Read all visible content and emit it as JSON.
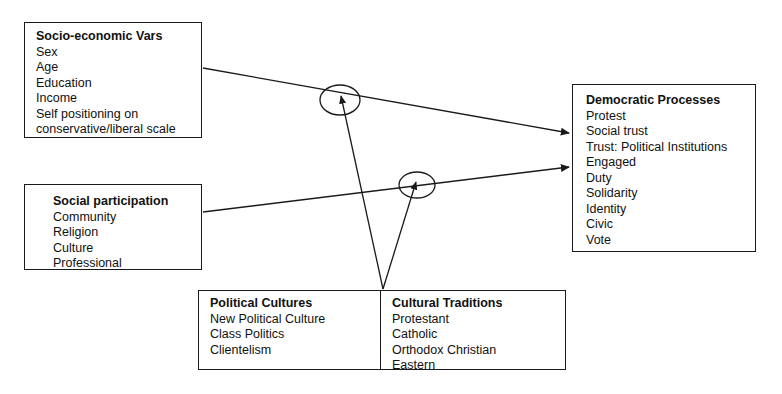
{
  "diagram": {
    "kind": "conceptual-path-model",
    "stroke_color": "#1a1a1a",
    "background_color": "#ffffff"
  },
  "nodes": {
    "socioeconomic": {
      "title": "Socio-economic Vars",
      "items": [
        "Sex",
        "Age",
        "Education",
        "Income",
        "Self positioning on",
        "conservative/liberal scale"
      ]
    },
    "social_participation": {
      "title": "Social participation",
      "items": [
        "Community",
        "Religion",
        "Culture",
        "Professional"
      ]
    },
    "democratic_processes": {
      "title": "Democratic Processes",
      "items": [
        "Protest",
        "Social trust",
        "Trust: Political Institutions",
        "Engaged",
        "Duty",
        "Solidarity",
        "Identity",
        "Civic",
        "Vote"
      ]
    },
    "political_cultures": {
      "title": "Political Cultures",
      "items": [
        "New Political Culture",
        "Class Politics",
        "Clientelism"
      ]
    },
    "cultural_traditions": {
      "title": "Cultural Traditions",
      "items": [
        "Protestant",
        "Catholic",
        "Orthodox Christian",
        "Eastern"
      ]
    }
  },
  "edges": [
    {
      "name": "socioeconomic-to-democratic",
      "from": "socioeconomic",
      "to": "democratic_processes",
      "arrowhead": "to",
      "moderated_by": "moderator-upper"
    },
    {
      "name": "social-participation-to-democratic",
      "from": "social_participation",
      "to": "democratic_processes",
      "arrowhead": "to",
      "moderated_by": "moderator-lower"
    },
    {
      "name": "cultures-to-moderator-upper",
      "from": "political_cultures_cultural_traditions_junction",
      "to": "moderator-upper",
      "arrowhead": "to",
      "moderated_by": null
    },
    {
      "name": "cultures-to-moderator-lower",
      "from": "political_cultures_cultural_traditions_junction",
      "to": "moderator-lower",
      "arrowhead": "to",
      "moderated_by": null
    }
  ],
  "moderators": [
    {
      "name": "moderator-upper",
      "cx": 340,
      "cy": 100,
      "rx": 20,
      "ry": 15
    },
    {
      "name": "moderator-lower",
      "cx": 417,
      "cy": 185,
      "rx": 18,
      "ry": 13
    }
  ]
}
